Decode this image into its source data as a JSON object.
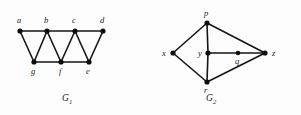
{
  "figure": {
    "background_color": "#fdfdfd",
    "ink_color": "#151515",
    "graphs": [
      {
        "id": "G1",
        "caption_base": "G",
        "caption_subscript": "1",
        "caption_full": "G1",
        "caption_x": 66,
        "caption_y": 101,
        "vertices": [
          {
            "name": "a",
            "label": "a",
            "x": 20,
            "y": 31,
            "label_x": 17,
            "label_y": 23
          },
          {
            "name": "b",
            "label": "b",
            "x": 47,
            "y": 31,
            "label_x": 44,
            "label_y": 23
          },
          {
            "name": "c",
            "label": "c",
            "x": 75,
            "y": 31,
            "label_x": 72,
            "label_y": 23
          },
          {
            "name": "d",
            "label": "d",
            "x": 103,
            "y": 31,
            "label_x": 100,
            "label_y": 23
          },
          {
            "name": "g",
            "label": "g",
            "x": 34,
            "y": 62,
            "label_x": 31,
            "label_y": 73
          },
          {
            "name": "f",
            "label": "f",
            "x": 61,
            "y": 62,
            "label_x": 59,
            "label_y": 73
          },
          {
            "name": "e",
            "label": "e",
            "x": 89,
            "y": 62,
            "label_x": 86,
            "label_y": 73
          }
        ],
        "edges": [
          {
            "from": "a",
            "to": "b"
          },
          {
            "from": "b",
            "to": "c"
          },
          {
            "from": "c",
            "to": "d"
          },
          {
            "from": "g",
            "to": "f"
          },
          {
            "from": "f",
            "to": "e"
          },
          {
            "from": "a",
            "to": "g"
          },
          {
            "from": "g",
            "to": "b"
          },
          {
            "from": "b",
            "to": "f"
          },
          {
            "from": "f",
            "to": "c"
          },
          {
            "from": "c",
            "to": "e"
          },
          {
            "from": "e",
            "to": "d"
          }
        ]
      },
      {
        "id": "G2",
        "caption_base": "G",
        "caption_subscript": "2",
        "caption_full": "G2",
        "caption_x": 210,
        "caption_y": 101,
        "vertices": [
          {
            "name": "p",
            "label": "p",
            "x": 207,
            "y": 23,
            "label_x": 204,
            "label_y": 15
          },
          {
            "name": "x",
            "label": "x",
            "x": 173,
            "y": 53,
            "label_x": 163,
            "label_y": 56
          },
          {
            "name": "y",
            "label": "y",
            "x": 208,
            "y": 53,
            "label_x": 199,
            "label_y": 56
          },
          {
            "name": "q",
            "label": "q",
            "x": 238,
            "y": 53,
            "label_x": 235,
            "label_y": 64
          },
          {
            "name": "z",
            "label": "z",
            "x": 265,
            "y": 53,
            "label_x": 272,
            "label_y": 56
          },
          {
            "name": "r",
            "label": "r",
            "x": 207,
            "y": 82,
            "label_x": 204,
            "label_y": 93
          }
        ],
        "edges": [
          {
            "from": "x",
            "to": "p"
          },
          {
            "from": "p",
            "to": "z"
          },
          {
            "from": "x",
            "to": "r"
          },
          {
            "from": "r",
            "to": "z"
          },
          {
            "from": "p",
            "to": "y"
          },
          {
            "from": "y",
            "to": "r"
          },
          {
            "from": "y",
            "to": "q"
          },
          {
            "from": "q",
            "to": "z"
          }
        ]
      }
    ]
  }
}
